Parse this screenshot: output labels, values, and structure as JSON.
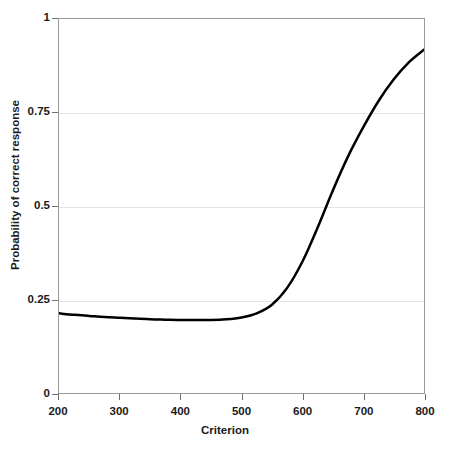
{
  "chart_data": {
    "type": "line",
    "title": "",
    "xlabel": "Criterion",
    "ylabel": "Probability of correct response",
    "xlim": [
      200,
      800
    ],
    "ylim": [
      0,
      1
    ],
    "grid": true,
    "legend": null,
    "xticks": [
      200,
      300,
      400,
      500,
      600,
      700,
      800
    ],
    "xtick_labels": [
      "200",
      "300",
      "400",
      "500",
      "600",
      "700",
      "800"
    ],
    "yticks": [
      0,
      0.25,
      0.5,
      0.75,
      1
    ],
    "ytick_labels": [
      "0",
      "0.25",
      "0.5",
      "0.75",
      "1"
    ],
    "series": [
      {
        "name": "probability of correct response",
        "color": "#000000",
        "line_width": 2.5,
        "x": [
          200,
          225,
          250,
          275,
          300,
          325,
          350,
          375,
          400,
          425,
          450,
          475,
          500,
          525,
          550,
          575,
          600,
          625,
          650,
          675,
          700,
          725,
          750,
          775,
          800
        ],
        "y": [
          0.213,
          0.209,
          0.206,
          0.203,
          0.201,
          0.199,
          0.197,
          0.196,
          0.195,
          0.195,
          0.195,
          0.197,
          0.202,
          0.213,
          0.236,
          0.281,
          0.351,
          0.442,
          0.541,
          0.632,
          0.71,
          0.78,
          0.838,
          0.884,
          0.918
        ]
      }
    ],
    "annotations": {
      "minimum_point": {
        "x": 450,
        "y": 0.195
      },
      "crossing_0_25": {
        "x": 556,
        "y": 0.25
      },
      "crossing_0_5": {
        "x": 630,
        "y": 0.5
      },
      "crossing_0_75": {
        "x": 695,
        "y": 0.75
      },
      "start_point": {
        "x": 200,
        "y": 0.213
      },
      "end_point": {
        "x": 800,
        "y": 0.918
      }
    }
  },
  "style": {
    "background": "#ffffff",
    "axis_border": "#9a9a9a",
    "gridline_color": "#e4e4e4",
    "tick_color": "#6e6e6e",
    "text_color": "#1a1a1a",
    "curve_color": "#000000"
  }
}
